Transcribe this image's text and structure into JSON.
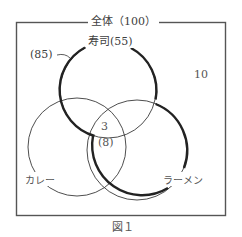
{
  "diagram": {
    "title": "全体（100）",
    "caption": "図１",
    "sets": [
      {
        "name": "寿司",
        "label": "寿司(55)",
        "count": 55
      },
      {
        "name": "カレー",
        "label": "カレー"
      },
      {
        "name": "ラーメン",
        "label": "ラーメン"
      }
    ],
    "annotations": {
      "union_sushi_ramen": "(85)",
      "outside": "10",
      "triple_intersection": "3",
      "triple_intersection_paren": "(8)"
    },
    "universe_total": 100,
    "colors": {
      "line": "#2a2a2a",
      "thin_line": "#3a3a3a",
      "frame": "#555555",
      "text": "#404040"
    }
  }
}
